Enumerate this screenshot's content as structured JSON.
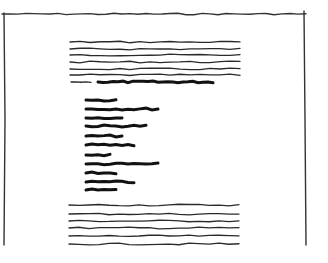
{
  "sketch": {
    "description": "Hand-drawn document wireframe sketch",
    "colors": {
      "background": "#ffffff",
      "ink": "#111111",
      "thin_ink": "#2a2a2a"
    },
    "frame": {
      "top_y": 14,
      "left_x": 4,
      "right_x": 304,
      "bottom_y": 245
    },
    "top_paragraph": {
      "x_start": 70,
      "x_end": 246,
      "lines_y": [
        42,
        49,
        55,
        62,
        69,
        75
      ]
    },
    "heading_line": {
      "y": 82,
      "dash": [
        71,
        91
      ],
      "bold": [
        98,
        214
      ]
    },
    "bold_list": {
      "x_start": 86,
      "items": [
        {
          "y": 100,
          "x_end": 120
        },
        {
          "y": 109,
          "x_end": 159
        },
        {
          "y": 118,
          "x_end": 125
        },
        {
          "y": 126,
          "x_end": 146
        },
        {
          "y": 136,
          "x_end": 123
        },
        {
          "y": 145,
          "x_end": 139
        },
        {
          "y": 155,
          "x_end": 111
        },
        {
          "y": 164,
          "x_end": 162
        },
        {
          "y": 173,
          "x_end": 116
        },
        {
          "y": 182,
          "x_end": 136
        },
        {
          "y": 190,
          "x_end": 118
        }
      ]
    },
    "bottom_paragraph": {
      "x_start": 69,
      "x_end": 246,
      "lines_y": [
        205,
        214,
        221,
        228,
        236,
        244
      ]
    }
  }
}
